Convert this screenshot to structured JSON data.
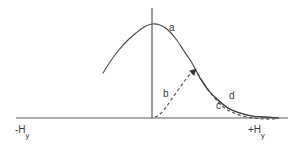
{
  "figure": {
    "title": "",
    "background_color": "#ffffff",
    "stroke_color": "#4a4a4a",
    "text_color": "#3a3a3a"
  },
  "axes": {
    "horizontal": {
      "name": "horizontal-axis",
      "x_start": 16,
      "x_end": 288,
      "y": 118,
      "left_label": "-H",
      "left_label_sub": "y",
      "right_label": "+H",
      "right_label_sub": "y"
    },
    "vertical": {
      "name": "vertical-axis",
      "x": 152,
      "y_top": 8,
      "y_bottom": 118
    }
  },
  "chart_data": {
    "type": "line",
    "title": "",
    "xlabel": "H_y",
    "ylabel": "",
    "xlim": [
      -1.0,
      1.0
    ],
    "ylim": [
      0,
      1.0
    ],
    "grid": false,
    "legend": "inline-annotations",
    "annotations": [
      {
        "label": "a",
        "x": 173,
        "y": 28,
        "describes": "solid-main-curve-peak-right-flank"
      },
      {
        "label": "b",
        "x": 167,
        "y": 94,
        "describes": "dashed-rising-branch"
      },
      {
        "label": "c",
        "x": 220,
        "y": 106,
        "describes": "dashed-lower-tail"
      },
      {
        "label": "d",
        "x": 233,
        "y": 96,
        "describes": "solid-upper-tail"
      }
    ],
    "markers": [
      {
        "type": "arrowhead",
        "x": 195,
        "y": 70,
        "direction": "up-right",
        "describes": "junction-of-dashed-b-and-solid-a"
      }
    ],
    "series": [
      {
        "name": "a",
        "style": "solid",
        "description": "Main bell-shaped curve, peak at vertical axis",
        "points_px": [
          [
            103,
            73
          ],
          [
            110,
            62
          ],
          [
            118,
            51
          ],
          [
            127,
            41
          ],
          [
            136,
            33
          ],
          [
            144,
            27
          ],
          [
            152,
            24
          ],
          [
            160,
            25
          ],
          [
            168,
            30
          ],
          [
            176,
            39
          ],
          [
            184,
            51
          ],
          [
            192,
            63
          ],
          [
            200,
            78
          ],
          [
            209,
            91
          ],
          [
            218,
            100
          ],
          [
            228,
            108
          ],
          [
            240,
            113
          ],
          [
            252,
            116
          ],
          [
            265,
            117
          ],
          [
            278,
            118
          ]
        ]
      },
      {
        "name": "b",
        "style": "dashed",
        "description": "Rising dashed branch from baseline to junction",
        "points_px": [
          [
            155,
            117
          ],
          [
            159,
            115
          ],
          [
            163,
            111
          ],
          [
            167,
            106
          ],
          [
            171,
            100
          ],
          [
            176,
            93
          ],
          [
            181,
            86
          ],
          [
            186,
            79
          ],
          [
            191,
            73
          ],
          [
            195,
            69
          ]
        ]
      },
      {
        "name": "c",
        "style": "dashed",
        "description": "Dashed lower tail falling below the solid curve",
        "points_px": [
          [
            195,
            69
          ],
          [
            201,
            79
          ],
          [
            207,
            88
          ],
          [
            213,
            96
          ],
          [
            219,
            103
          ],
          [
            226,
            109
          ],
          [
            234,
            113
          ],
          [
            243,
            116
          ],
          [
            253,
            118
          ],
          [
            264,
            119
          ],
          [
            275,
            119
          ]
        ]
      },
      {
        "name": "d",
        "style": "solid",
        "description": "Solid upper tail sitting above the dashed c tail",
        "points_px": [
          [
            200,
            78
          ],
          [
            209,
            91
          ],
          [
            218,
            100
          ],
          [
            228,
            108
          ],
          [
            240,
            113
          ],
          [
            252,
            116
          ],
          [
            265,
            117
          ],
          [
            278,
            118
          ]
        ]
      }
    ]
  },
  "labels": {
    "a": "a",
    "b": "b",
    "c": "c",
    "d": "d"
  }
}
